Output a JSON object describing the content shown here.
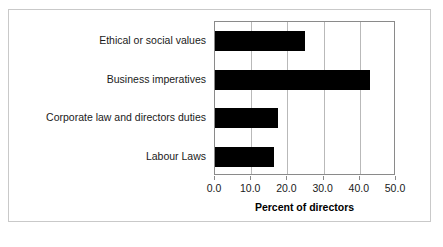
{
  "chart_data": {
    "type": "bar",
    "orientation": "horizontal",
    "title": "",
    "subtitle": "",
    "xlabel": "Percent of directors",
    "ylabel": "",
    "categories": [
      "Ethical or social values",
      "Business imperatives",
      "Corporate law and directors duties",
      "Labour Laws"
    ],
    "values": [
      24.8,
      42.7,
      17.4,
      16.4
    ],
    "xlim": [
      0.0,
      50.0
    ],
    "xticks": [
      0.0,
      10.0,
      20.0,
      30.0,
      40.0,
      50.0
    ],
    "xtick_labels": [
      "0.0",
      "10.0",
      "20.0",
      "30.0",
      "40.0",
      "50.0"
    ],
    "grid": "vertical",
    "legend": null,
    "bar_color": "#000000",
    "plot_background": "#ffffff",
    "gridline_color": "#b9b9b9",
    "axis_color": "#8a8a8a",
    "border_color": "#c9c9c9"
  }
}
